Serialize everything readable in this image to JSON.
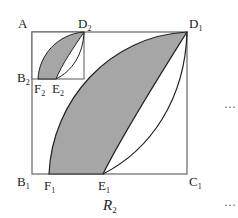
{
  "figure": {
    "caption": "R",
    "caption_sub": "2",
    "ellipsis": "…",
    "colors": {
      "shade": "#a6a6a6",
      "stroke": "#222222",
      "square": "#666666"
    },
    "points": {
      "A": {
        "name": "A",
        "sub": ""
      },
      "D2": {
        "name": "D",
        "sub": "2"
      },
      "D1": {
        "name": "D",
        "sub": "1"
      },
      "B2": {
        "name": "B",
        "sub": "2"
      },
      "F2": {
        "name": "F",
        "sub": "2"
      },
      "E2": {
        "name": "E",
        "sub": "2"
      },
      "B1": {
        "name": "B",
        "sub": "1"
      },
      "F1": {
        "name": "F",
        "sub": "1"
      },
      "E1": {
        "name": "E",
        "sub": "1"
      },
      "C1": {
        "name": "C",
        "sub": "1"
      }
    }
  }
}
